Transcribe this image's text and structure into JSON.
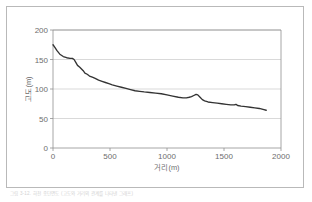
{
  "figure": {
    "caption": "그림 3-12. 하천 종단면도 (고도와 거리의 관계를 나타낸 그래프)"
  },
  "chart_data": {
    "type": "line",
    "title": "",
    "xlabel": "거리(m)",
    "ylabel": "고도(m)",
    "xlim": [
      0,
      2000
    ],
    "ylim": [
      0,
      200
    ],
    "xticks": [
      0,
      500,
      1000,
      1500,
      2000
    ],
    "yticks": [
      0,
      50,
      100,
      150,
      200
    ],
    "grid": "horizontal",
    "legend": "none",
    "line_color": "#333333",
    "series": [
      {
        "name": "종단면",
        "x": [
          0,
          15,
          35,
          60,
          90,
          120,
          150,
          170,
          185,
          200,
          215,
          235,
          250,
          265,
          280,
          300,
          320,
          345,
          370,
          400,
          430,
          460,
          490,
          520,
          560,
          600,
          640,
          680,
          720,
          760,
          800,
          850,
          900,
          950,
          1000,
          1050,
          1100,
          1140,
          1170,
          1195,
          1215,
          1235,
          1255,
          1270,
          1290,
          1310,
          1330,
          1360,
          1400,
          1440,
          1480,
          1520,
          1560,
          1590,
          1605,
          1620,
          1650,
          1690,
          1730,
          1770,
          1810,
          1850,
          1870
        ],
        "y": [
          175,
          171,
          165,
          159,
          155,
          153,
          152,
          152,
          150,
          145,
          140,
          137,
          134,
          131,
          127,
          125,
          122,
          120,
          118,
          115,
          113,
          111,
          109,
          107,
          105,
          103,
          101,
          99,
          97,
          96,
          95,
          94,
          93,
          92,
          90,
          88,
          86,
          85,
          85,
          86,
          87,
          89,
          91,
          90,
          86,
          82,
          80,
          78,
          77,
          76,
          75,
          74,
          73,
          73,
          74,
          72,
          71,
          70,
          69,
          68,
          67,
          65,
          64
        ]
      }
    ]
  }
}
